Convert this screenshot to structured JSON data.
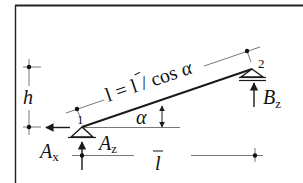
{
  "diagram": {
    "type": "inclined-beam-free-body",
    "colors": {
      "line": "#1a1a1a",
      "thin": "#555555",
      "background": "#ffffff"
    },
    "labels": {
      "length_formula": {
        "lhs": "l",
        "eq": " = ",
        "rhs_bar": "l",
        "slash": " / cos ",
        "alpha": "α"
      },
      "height": "h",
      "angle": "α",
      "span": "l",
      "support_1": "1",
      "support_2": "2",
      "reaction_ax": {
        "base": "A",
        "sub": "x"
      },
      "reaction_az": {
        "base": "A",
        "sub": "z"
      },
      "reaction_bz": {
        "base": "B",
        "sub": "z"
      }
    },
    "nodes": [
      {
        "id": "1",
        "support": "pin"
      },
      {
        "id": "2",
        "support": "roller"
      }
    ],
    "reactions": [
      {
        "name": "A_x",
        "direction": "left",
        "at": "1"
      },
      {
        "name": "A_z",
        "direction": "up",
        "at": "1"
      },
      {
        "name": "B_z",
        "direction": "up",
        "at": "2"
      }
    ]
  }
}
